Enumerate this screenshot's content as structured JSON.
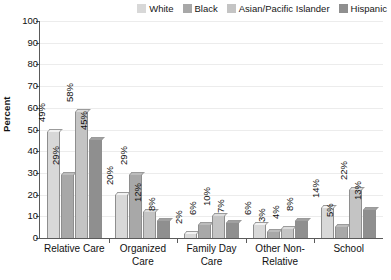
{
  "chart_data": {
    "type": "bar",
    "title": "",
    "xlabel": "",
    "ylabel": "Percent",
    "ylim": [
      0,
      100
    ],
    "ytick_step": 10,
    "yticks": [
      100,
      90,
      80,
      70,
      60,
      50,
      40,
      30,
      20,
      10,
      0
    ],
    "grid": true,
    "legend_position": "top-right",
    "value_suffix": "%",
    "categories": [
      "Relative Care",
      "Organized Care",
      "Family Day Care",
      "Other Non-Relative",
      "School"
    ],
    "category_lines": [
      [
        "Relative Care"
      ],
      [
        "Organized",
        "Care"
      ],
      [
        "Family Day",
        "Care"
      ],
      [
        "Other Non-",
        "Relative"
      ],
      [
        "School"
      ]
    ],
    "series": [
      {
        "name": "White",
        "color": "#d8d8d8",
        "values": [
          49,
          20,
          2,
          6,
          14
        ],
        "labels": [
          "49%",
          "20%",
          "2%",
          "6%",
          "14%"
        ]
      },
      {
        "name": "Black",
        "color": "#a8a8a8",
        "values": [
          29,
          29,
          6,
          3,
          5
        ],
        "labels": [
          "29%",
          "29%",
          "6%",
          "3%",
          "5%"
        ]
      },
      {
        "name": "Asian/Pacific Islander",
        "color": "#c4c4c4",
        "values": [
          58,
          12,
          10,
          4,
          22
        ],
        "labels": [
          "58%",
          "12%",
          "10%",
          "4%",
          "22%"
        ]
      },
      {
        "name": "Hispanic",
        "color": "#8f8f8f",
        "values": [
          45,
          8,
          7,
          8,
          13
        ],
        "labels": [
          "45%",
          "8%",
          "7%",
          "8%",
          "13%"
        ]
      }
    ]
  }
}
